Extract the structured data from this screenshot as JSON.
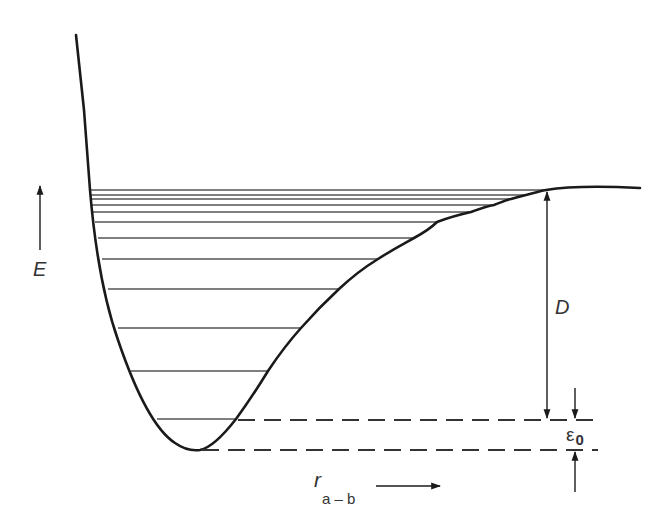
{
  "figure": {
    "type": "potential_energy_curve",
    "labels": {
      "energy_axis": "E",
      "distance_axis_main": "r",
      "distance_axis_sub": "a – b",
      "dissociation_energy": "D",
      "zero_point_energy_symbol": "ε",
      "zero_point_energy_sub": "0"
    },
    "vibrational_levels_count": 13,
    "colors": {
      "curve": "#1a1a1a",
      "levels": "#555555",
      "background": "#ffffff"
    }
  }
}
